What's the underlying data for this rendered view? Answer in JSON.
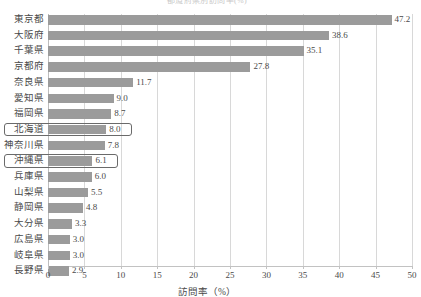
{
  "cut_title": "都道府県別訪問率(%)",
  "chart_data": {
    "type": "bar",
    "orientation": "horizontal",
    "title": "",
    "xlabel": "訪問率（%）",
    "ylabel": "",
    "xlim": [
      0,
      50
    ],
    "xticks": [
      0,
      5,
      10,
      15,
      20,
      25,
      30,
      35,
      40,
      45,
      50
    ],
    "grid": true,
    "legend": null,
    "bar_color": "#9b9b9b",
    "highlight_color": "#6a6a6a",
    "categories": [
      "東京都",
      "大阪府",
      "千葉県",
      "京都府",
      "奈良県",
      "愛知県",
      "福岡県",
      "北海道",
      "神奈川県",
      "沖縄県",
      "兵庫県",
      "山梨県",
      "静岡県",
      "大分県",
      "広島県",
      "岐阜県",
      "長野県"
    ],
    "values": [
      47.2,
      38.6,
      35.1,
      27.8,
      11.7,
      9.0,
      8.7,
      8.0,
      7.8,
      6.1,
      6.0,
      5.5,
      4.8,
      3.3,
      3.0,
      3.0,
      2.9
    ],
    "value_labels": [
      "47.2",
      "38.6",
      "35.1",
      "27.8",
      "11.7",
      "9.0",
      "8.7",
      "8.0",
      "7.8",
      "6.1",
      "6.0",
      "5.5",
      "4.8",
      "3.3",
      "3.0",
      "3.0",
      "2.9"
    ],
    "highlighted": [
      "北海道",
      "沖縄県"
    ]
  }
}
